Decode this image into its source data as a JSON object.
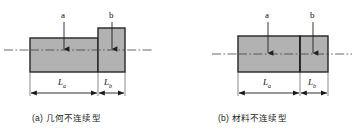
{
  "figure": {
    "type": "engineering-diagram",
    "style": {
      "fill_color": "#b2b2b2",
      "outline_color": "#262626",
      "centerline_color": "#4d4d4d",
      "dimension_color": "#1a1a1a",
      "background": "#ffffff"
    },
    "panels": [
      {
        "id": "a",
        "caption": "(a) 几何不连续型",
        "callouts": [
          {
            "label": "a",
            "x": 64,
            "target_x": 64,
            "target_y": 50
          },
          {
            "label": "b",
            "x": 112,
            "target_x": 112,
            "target_y": 50
          }
        ],
        "dimensions": [
          {
            "label": "L",
            "sub": "a",
            "from_x": 30,
            "to_x": 98
          },
          {
            "label": "L",
            "sub": "b",
            "from_x": 98,
            "to_x": 125
          }
        ],
        "shapes": [
          {
            "name": "section-a-body",
            "x": 30,
            "y": 38,
            "w": 68,
            "h": 34
          },
          {
            "name": "section-b-body",
            "x": 98,
            "y": 28,
            "w": 27,
            "h": 44
          }
        ],
        "centerline": {
          "from_x": 4,
          "to_x": 152,
          "y": 50
        }
      },
      {
        "id": "b",
        "caption": "(b) 材料不连续型",
        "callouts": [
          {
            "label": "a",
            "x": 268,
            "target_x": 268,
            "target_y": 50
          },
          {
            "label": "b",
            "x": 313,
            "target_x": 313,
            "target_y": 50
          }
        ],
        "dimensions": [
          {
            "label": "L",
            "sub": "a",
            "from_x": 238,
            "to_x": 300
          },
          {
            "label": "L",
            "sub": "b",
            "from_x": 300,
            "to_x": 328
          }
        ],
        "shapes": [
          {
            "name": "material-a-body",
            "x": 238,
            "y": 36,
            "w": 62,
            "h": 36
          },
          {
            "name": "material-b-body",
            "x": 300,
            "y": 36,
            "w": 28,
            "h": 36
          }
        ],
        "centerline": {
          "from_x": 212,
          "to_x": 352,
          "y": 54
        }
      }
    ]
  },
  "labels": {
    "callout_a": "a",
    "callout_b": "b",
    "dim_L": "L",
    "dim_sub_a": "a",
    "dim_sub_b": "b"
  },
  "captions": {
    "panel_a": "(a) 几何不连续型",
    "panel_b": "(b) 材料不连续型"
  }
}
